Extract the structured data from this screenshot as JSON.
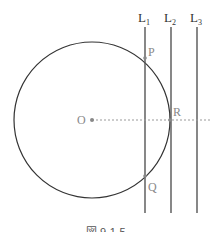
{
  "diagram": {
    "circle": {
      "center_label": "O",
      "cx": 92,
      "cy": 120,
      "r": 78,
      "stroke": "#333333"
    },
    "points": {
      "P": {
        "label": "P",
        "x": 145,
        "y": 58
      },
      "Q": {
        "label": "Q",
        "x": 145,
        "y": 176
      },
      "R": {
        "label": "R",
        "x": 170,
        "y": 120
      }
    },
    "lines": [
      {
        "label": "L",
        "sub": "1",
        "x": 145
      },
      {
        "label": "L",
        "sub": "2",
        "x": 171
      },
      {
        "label": "L",
        "sub": "3",
        "x": 197
      }
    ],
    "caption": "図 9-1-5"
  }
}
